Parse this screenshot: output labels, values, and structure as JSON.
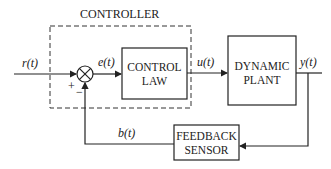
{
  "diagram": {
    "controller_label": "CONTROLLER",
    "blocks": {
      "control_law": {
        "line1": "CONTROL",
        "line2": "LAW"
      },
      "plant": {
        "line1": "DYNAMIC",
        "line2": "PLANT"
      },
      "sensor": {
        "line1": "FEEDBACK",
        "line2": "SENSOR"
      }
    },
    "signals": {
      "reference": "r(t)",
      "error": "e(t)",
      "control": "u(t)",
      "output": "y(t)",
      "feedback": "b(t)"
    },
    "summing_signs": {
      "plus": "+",
      "minus": "−"
    }
  }
}
